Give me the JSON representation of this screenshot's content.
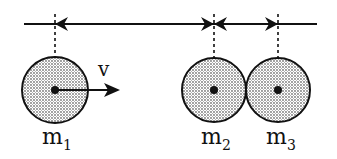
{
  "diagram": {
    "colors": {
      "ink": "#111111",
      "fill_dots": "#9a9a9a",
      "background": "#ffffff"
    },
    "reference_line": {
      "y": 24,
      "x1": 24,
      "x2": 317
    },
    "balls": [
      {
        "id": "m1",
        "label_main": "m",
        "label_sub": "1",
        "cx": 55,
        "cy": 90,
        "r": 33
      },
      {
        "id": "m2",
        "label_main": "m",
        "label_sub": "2",
        "cx": 214,
        "cy": 90,
        "r": 32
      },
      {
        "id": "m3",
        "label_main": "m",
        "label_sub": "3",
        "cx": 278,
        "cy": 90,
        "r": 32
      }
    ],
    "velocity": {
      "label": "v",
      "from_x": 55,
      "to_x": 120,
      "y": 90
    }
  }
}
